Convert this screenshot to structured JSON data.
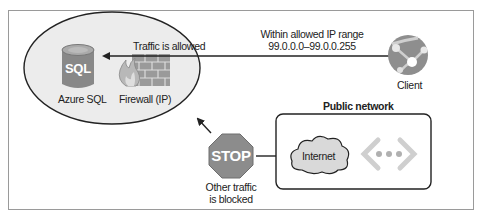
{
  "diagram": {
    "zone": {
      "database_label": "Azure SQL",
      "database_icon_text": "SQL",
      "firewall_label": "Firewall (IP)"
    },
    "allowed_flow": {
      "label": "Traffic is allowed",
      "range_title": "Within allowed IP range",
      "range_value": "99.0.0.0–99.0.0.255"
    },
    "client": {
      "label": "Client"
    },
    "blocked": {
      "stop_text": "STOP",
      "label_line1": "Other traffic",
      "label_line2": "is blocked"
    },
    "public_network": {
      "title": "Public network",
      "internet_label": "Internet"
    },
    "colors": {
      "zone_fill": "#ececec",
      "icon_gray": "#8a8a8a",
      "stop_fill": "#8c8c8c",
      "cloud_fill": "#d9d9d9",
      "line": "#333333"
    }
  }
}
